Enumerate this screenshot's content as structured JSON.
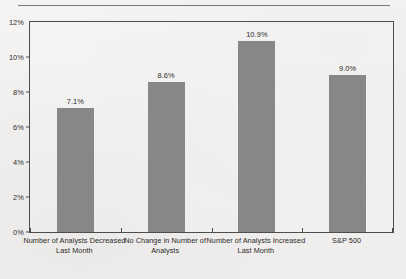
{
  "chart_data": {
    "type": "bar",
    "title": "",
    "xlabel": "",
    "ylabel": "",
    "ylim": [
      0,
      12
    ],
    "ytick_labels": [
      "0%",
      "2%",
      "4%",
      "6%",
      "8%",
      "10%",
      "12%"
    ],
    "ytick_values": [
      0,
      2,
      4,
      6,
      8,
      10,
      12
    ],
    "grid": false,
    "legend": null,
    "bar_color": "#878787",
    "axis_color": "#4d4d4d",
    "categories": [
      "Number of Analysts Decreased Last Month",
      "No Change in Number of Analysts",
      "Number of Analysts Increased Last Month",
      "S&P 500"
    ],
    "category_lines": [
      [
        "Number of Analysts Decreased",
        "Last Month"
      ],
      [
        "No Change in Number of",
        "Analysts"
      ],
      [
        "Number of Analysts Increased",
        "Last Month"
      ],
      [
        "S&P 500"
      ]
    ],
    "values": [
      7.1,
      8.6,
      10.9,
      9.0
    ],
    "value_labels": [
      "7.1%",
      "8.6%",
      "10.9%",
      "9.0%"
    ]
  }
}
